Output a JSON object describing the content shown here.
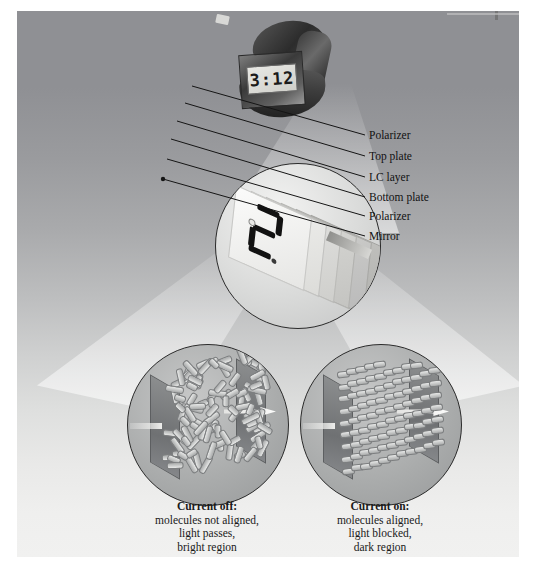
{
  "figure": {
    "background_color": "#ffffff",
    "panel_gradient_top": "#8f9094",
    "panel_gradient_bottom": "#f1f1f0"
  },
  "watch": {
    "name": "digital wristwatch",
    "display_time": "3:12",
    "band_color": "#3a3a3a",
    "screen_color": "#e8e8e4"
  },
  "middle_lens": {
    "name": "exploded LCD layer stack",
    "digit": "2"
  },
  "callouts": [
    {
      "label": "Polarizer",
      "x": 367,
      "y": 129
    },
    {
      "label": "Top plate",
      "x": 367,
      "y": 150
    },
    {
      "label": "LC layer",
      "x": 367,
      "y": 171
    },
    {
      "label": "Bottom plate",
      "x": 367,
      "y": 191
    },
    {
      "label": "Polarizer",
      "x": 367,
      "y": 210
    },
    {
      "label": "Mirror",
      "x": 367,
      "y": 230
    }
  ],
  "left_panel": {
    "heading": "Current off:",
    "lines": [
      "molecules not aligned,",
      "light passes,",
      "bright region"
    ],
    "molecule_state": "random"
  },
  "right_panel": {
    "heading": "Current on:",
    "lines": [
      "molecules aligned,",
      "light blocked,",
      "dark region"
    ],
    "molecule_state": "aligned"
  }
}
